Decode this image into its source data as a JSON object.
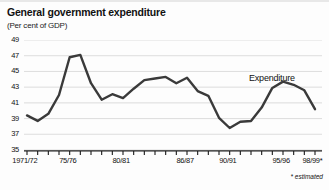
{
  "title": "General government expenditure",
  "subtitle": "(Per cent of GDP)",
  "series_label": "Expenditure",
  "footnote": "* estimated",
  "colors": {
    "line": "#3a3a3a",
    "grid": "#d9d9d9",
    "axis": "#1a1a1a",
    "background": "#fdfdfd"
  },
  "chart_data": {
    "type": "line",
    "title": "General government expenditure",
    "subtitle": "(Per cent of GDP)",
    "xlabel": "",
    "ylabel": "Per cent of GDP",
    "ylim": [
      35,
      49
    ],
    "yticks": [
      35,
      37,
      39,
      41,
      43,
      45,
      47,
      49
    ],
    "xtick_labels": [
      "1971/72",
      "75/76",
      "80/81",
      "86/87",
      "90/91",
      "95/96",
      "98/99*"
    ],
    "xtick_indices": [
      0,
      4,
      9,
      15,
      19,
      24,
      27
    ],
    "grid": true,
    "legend": "none",
    "annotations": [
      {
        "text": "Expenditure",
        "x_index": 25,
        "y_value": 45.2
      },
      {
        "text": "* estimated",
        "position": "bottom-right"
      }
    ],
    "series": [
      {
        "name": "Expenditure",
        "x": [
          "1971/72",
          "72/73",
          "73/74",
          "74/75",
          "75/76",
          "76/77",
          "77/78",
          "78/79",
          "79/80",
          "80/81",
          "81/82",
          "82/83",
          "83/84",
          "84/85",
          "85/86",
          "86/87",
          "87/88",
          "88/89",
          "89/90",
          "90/91",
          "91/92",
          "92/93",
          "93/94",
          "94/95",
          "95/96",
          "96/97",
          "97/98",
          "98/99*"
        ],
        "values": [
          39.4,
          38.7,
          39.6,
          42.0,
          46.8,
          47.1,
          43.5,
          41.4,
          42.1,
          41.6,
          42.8,
          43.9,
          44.1,
          44.3,
          43.5,
          44.2,
          42.5,
          41.9,
          39.1,
          37.8,
          38.6,
          38.7,
          40.4,
          42.9,
          43.7,
          43.3,
          42.6,
          40.2
        ]
      }
    ]
  }
}
